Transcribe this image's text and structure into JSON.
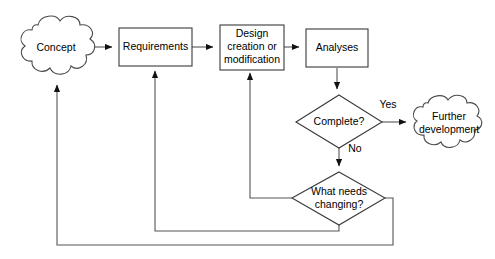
{
  "diagram": {
    "type": "flowchart",
    "background_color": "#ffffff",
    "line_color": "#555555",
    "text_color": "#000000",
    "nodes": [
      {
        "id": "concept",
        "label": "Concept",
        "shape": "cloud",
        "cx": 56,
        "cy": 48
      },
      {
        "id": "requirements",
        "label": "Requirements",
        "shape": "rect",
        "cx": 155,
        "cy": 47
      },
      {
        "id": "design_l1",
        "label": "Design",
        "shape": "rect",
        "cx": 251,
        "cy": 47
      },
      {
        "id": "design_l2",
        "label": "creation or",
        "shape": "rect",
        "cx": 251,
        "cy": 47
      },
      {
        "id": "design_l3",
        "label": "modification",
        "shape": "rect",
        "cx": 251,
        "cy": 47
      },
      {
        "id": "analyses",
        "label": "Analyses",
        "shape": "rect",
        "cx": 337,
        "cy": 48
      },
      {
        "id": "complete",
        "label": "Complete?",
        "shape": "diamond",
        "cx": 339,
        "cy": 122
      },
      {
        "id": "further_l1",
        "label": "Further",
        "shape": "cloud",
        "cx": 449,
        "cy": 124
      },
      {
        "id": "further_l2",
        "label": "development",
        "shape": "cloud",
        "cx": 449,
        "cy": 124
      },
      {
        "id": "changing_l1",
        "label": "What needs",
        "shape": "diamond",
        "cx": 339,
        "cy": 198
      },
      {
        "id": "changing_l2",
        "label": "changing?",
        "shape": "diamond",
        "cx": 339,
        "cy": 198
      }
    ],
    "edge_labels": [
      {
        "id": "yes",
        "label": "Yes",
        "x": 388,
        "y": 105
      },
      {
        "id": "no",
        "label": "No",
        "x": 355,
        "y": 149
      }
    ],
    "edges": [
      {
        "from": "concept",
        "to": "requirements",
        "label": ""
      },
      {
        "from": "requirements",
        "to": "design",
        "label": ""
      },
      {
        "from": "design",
        "to": "analyses",
        "label": ""
      },
      {
        "from": "analyses",
        "to": "complete",
        "label": ""
      },
      {
        "from": "complete",
        "to": "further",
        "label": "Yes"
      },
      {
        "from": "complete",
        "to": "changing",
        "label": "No"
      },
      {
        "from": "changing",
        "to": "design",
        "label": ""
      },
      {
        "from": "changing",
        "to": "requirements",
        "label": ""
      },
      {
        "from": "changing",
        "to": "concept",
        "label": ""
      }
    ]
  }
}
